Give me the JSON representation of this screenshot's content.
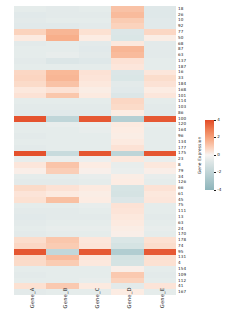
{
  "chart_data": {
    "type": "heatmap",
    "title": "",
    "xlabel": "",
    "ylabel": "",
    "colorbar_label": "Gene Expression",
    "colorbar_ticks": [
      "4",
      "2",
      "0",
      "-2",
      "-4"
    ],
    "vmin": -4,
    "vmax": 4,
    "colormap": "RdBu_r",
    "grid": false,
    "legend_position": "right",
    "columns": [
      "Gene_A",
      "Gene_B",
      "Gene_C",
      "Gene_D",
      "Gene_E"
    ],
    "rows": [
      "18",
      "26",
      "10",
      "92",
      "77",
      "50",
      "68",
      "87",
      "63",
      "137",
      "187",
      "16",
      "33",
      "184",
      "168",
      "101",
      "114",
      "103",
      "86",
      "100",
      "120",
      "164",
      "96",
      "134",
      "177",
      "175",
      "23",
      "8",
      "79",
      "34",
      "126",
      "66",
      "61",
      "45",
      "75",
      "111",
      "13",
      "63",
      "24",
      "170",
      "178",
      "74",
      "95",
      "131",
      "4",
      "154",
      "109",
      "112",
      "41",
      "167"
    ],
    "values": [
      [
        -0.3,
        -0.35,
        -0.3,
        1.3,
        -0.45
      ],
      [
        -0.4,
        -0.35,
        -0.35,
        1.45,
        -0.45
      ],
      [
        -0.35,
        -0.3,
        -0.3,
        1.1,
        -0.4
      ],
      [
        -0.4,
        -0.4,
        -0.35,
        0.95,
        -0.4
      ],
      [
        0.95,
        1.55,
        0.6,
        -0.55,
        0.85
      ],
      [
        0.35,
        1.7,
        0.3,
        -0.6,
        0.25
      ],
      [
        -0.35,
        -0.3,
        -0.35,
        0.4,
        -0.35
      ],
      [
        -0.3,
        -0.3,
        -0.4,
        1.55,
        -0.35
      ],
      [
        -0.3,
        -0.25,
        -0.35,
        1.45,
        -0.35
      ],
      [
        -0.35,
        -0.55,
        -0.45,
        0.55,
        -0.3
      ],
      [
        -0.3,
        -0.3,
        -0.3,
        0.45,
        -0.3
      ],
      [
        0.85,
        1.5,
        0.55,
        -0.55,
        0.45
      ],
      [
        0.9,
        1.55,
        0.5,
        -0.6,
        0.7
      ],
      [
        0.75,
        1.3,
        0.4,
        -0.35,
        0.55
      ],
      [
        0.4,
        0.55,
        0.25,
        -0.4,
        0.3
      ],
      [
        0.55,
        1.2,
        0.35,
        -0.55,
        0.45
      ],
      [
        -0.3,
        -0.3,
        -0.3,
        0.85,
        -0.3
      ],
      [
        -0.35,
        -0.35,
        -0.35,
        0.75,
        -0.35
      ],
      [
        -0.4,
        -0.4,
        -0.4,
        0.3,
        -0.4
      ],
      [
        3.8,
        -1.3,
        3.7,
        -1.6,
        3.7
      ],
      [
        -0.3,
        -0.25,
        -0.2,
        0.35,
        -0.25
      ],
      [
        -0.3,
        -0.3,
        -0.25,
        0.3,
        -0.3
      ],
      [
        -0.35,
        -0.3,
        -0.3,
        0.25,
        -0.3
      ],
      [
        -0.3,
        -0.3,
        -0.3,
        0.35,
        -0.3
      ],
      [
        -0.35,
        -0.3,
        -0.3,
        0.55,
        -0.3
      ],
      [
        3.85,
        -1.1,
        3.75,
        -1.35,
        3.75
      ],
      [
        -0.25,
        -0.2,
        -0.15,
        0.4,
        -0.2
      ],
      [
        0.45,
        1.25,
        0.3,
        -0.25,
        0.4
      ],
      [
        0.2,
        1.05,
        0.15,
        -0.2,
        0.2
      ],
      [
        -0.3,
        -0.3,
        -0.25,
        0.25,
        -0.25
      ],
      [
        -0.35,
        -0.35,
        -0.3,
        0.3,
        -0.3
      ],
      [
        0.75,
        0.55,
        0.35,
        -0.7,
        0.55
      ],
      [
        0.5,
        0.35,
        0.25,
        -0.75,
        0.4
      ],
      [
        0.6,
        1.35,
        0.3,
        -0.55,
        0.45
      ],
      [
        -0.3,
        -0.3,
        -0.25,
        0.55,
        -0.3
      ],
      [
        -0.35,
        -0.35,
        -0.3,
        0.5,
        -0.3
      ],
      [
        -0.4,
        -0.35,
        -0.35,
        0.4,
        -0.35
      ],
      [
        -0.35,
        -0.3,
        -0.3,
        0.35,
        -0.3
      ],
      [
        -0.3,
        -0.25,
        -0.25,
        0.25,
        -0.25
      ],
      [
        -0.35,
        -0.3,
        -0.3,
        0.2,
        -0.3
      ],
      [
        0.7,
        1.2,
        0.45,
        -0.6,
        0.6
      ],
      [
        0.85,
        1.1,
        0.5,
        -0.75,
        0.7
      ],
      [
        3.75,
        -1.25,
        3.7,
        -1.7,
        3.7
      ],
      [
        0.8,
        1.45,
        0.45,
        -0.8,
        0.65
      ],
      [
        0.75,
        1.1,
        0.4,
        -0.75,
        0.6
      ],
      [
        -0.3,
        -0.3,
        -0.3,
        0.2,
        -0.3
      ],
      [
        -0.35,
        -0.3,
        -0.3,
        1.15,
        -0.35
      ],
      [
        -0.3,
        -0.3,
        -0.25,
        0.95,
        -0.3
      ],
      [
        0.6,
        1.15,
        0.35,
        -0.35,
        0.5
      ],
      [
        -0.35,
        -0.3,
        -0.3,
        0.3,
        -0.3
      ]
    ]
  }
}
